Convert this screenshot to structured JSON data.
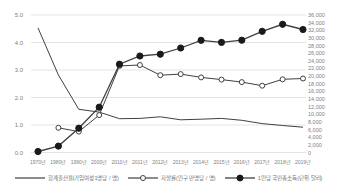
{
  "chart_data": {
    "type": "line",
    "title": "",
    "categories": [
      "1970년",
      "1980년",
      "1990년",
      "2000년",
      "2010년",
      "2011년",
      "2012년",
      "2013년",
      "2014년",
      "2015년",
      "2016년",
      "2017년",
      "2018년",
      "2019년"
    ],
    "series": [
      {
        "name": "합계출산율(가임여성1명당 / 명)",
        "axis": "left",
        "marker": "none",
        "values": [
          4.53,
          2.82,
          1.57,
          1.47,
          1.23,
          1.24,
          1.3,
          1.19,
          1.21,
          1.24,
          1.17,
          1.05,
          0.98,
          0.92
        ]
      },
      {
        "name": "자살률(인구 만명당 / 명)",
        "axis": "left",
        "marker": "open-circle",
        "values": [
          null,
          0.9,
          0.76,
          1.36,
          3.15,
          3.18,
          2.81,
          2.85,
          2.73,
          2.65,
          2.56,
          2.43,
          2.66,
          2.69
        ]
      },
      {
        "name": "1인당 국민총소득(단위 달러)",
        "axis": "right",
        "marker": "filled-circle",
        "values": [
          257,
          1686,
          6360,
          11865,
          23118,
          25256,
          25724,
          27351,
          29384,
          28814,
          29394,
          31734,
          33564,
          32204
        ]
      }
    ],
    "y_left": {
      "min": 0,
      "max": 5,
      "step": 1,
      "tick_labels": [
        "0.0",
        "1.0",
        "2.0",
        "3.0",
        "4.0",
        "5.0"
      ]
    },
    "y_right": {
      "min": 0,
      "max": 36000,
      "step": 2000,
      "tick_labels": [
        "0",
        "2,000",
        "4,000",
        "6,000",
        "8,000",
        "10,000",
        "12,000",
        "14,000",
        "16,000",
        "18,000",
        "20,000",
        "22,000",
        "24,000",
        "26,000",
        "28,000",
        "30,000",
        "32,000",
        "34,000",
        "36,000"
      ]
    },
    "grid": true,
    "legend_position": "bottom",
    "colors": {
      "line": "#404040",
      "marker_fill": "#1a1a1a",
      "grid": "#d9d9d9",
      "axis_text": "#808080",
      "background": "#ffffff"
    }
  }
}
